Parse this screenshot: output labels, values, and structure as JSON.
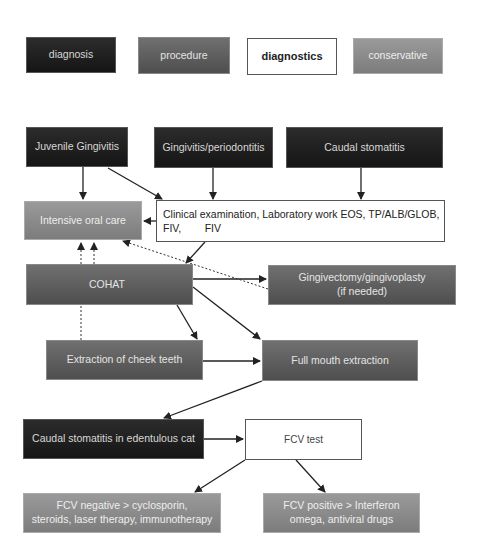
{
  "legend": {
    "diagnosis": "diagnosis",
    "procedure": "procedure",
    "diagnostics": "diagnostics",
    "conservative": "conservative"
  },
  "colors": {
    "diagnosis": "#1e1e1e",
    "procedure": "#5f5f5f",
    "diagnostics": "#ffffff",
    "conservative": "#8a8a8a",
    "edge": "#222222"
  },
  "nodes": {
    "juvenile_gingivitis": "Juvenile Gingivitis",
    "gingivitis_periodontitis": "Gingivitis/periodontitis",
    "caudal_stomatitis": "Caudal stomatitis",
    "intensive_oral_care": "Intensive oral care",
    "clinical_examination_line1": "Clinical examination, Laboratory work EOS, TP/ALB/GLOB,",
    "clinical_examination_line2": "FIV,        FIV",
    "cohat": "COHAT",
    "gingivectomy_line1": "Gingivectomy/gingivoplasty",
    "gingivectomy_line2": "(if needed)",
    "extraction_cheek_teeth": "Extraction of cheek teeth",
    "full_mouth_extraction": "Full mouth extraction",
    "caudal_stomatitis_edentulous": "Caudal stomatitis in edentulous cat",
    "fcv_test": "FCV test",
    "fcv_negative_line1": "FCV negative > cyclosporin,",
    "fcv_negative_line2": "steroids, laser therapy, immunotherapy",
    "fcv_positive_line1": "FCV positive > Interferon",
    "fcv_positive_line2": "omega, antiviral drugs"
  },
  "edges": [
    {
      "from": "Juvenile Gingivitis",
      "to": "Intensive oral care",
      "style": "solid"
    },
    {
      "from": "Juvenile Gingivitis",
      "to": "Clinical examination",
      "style": "solid"
    },
    {
      "from": "Gingivitis/periodontitis",
      "to": "Clinical examination",
      "style": "solid"
    },
    {
      "from": "Caudal stomatitis",
      "to": "Clinical examination",
      "style": "solid"
    },
    {
      "from": "Clinical examination",
      "to": "Intensive oral care",
      "style": "solid"
    },
    {
      "from": "Clinical examination",
      "to": "COHAT",
      "style": "solid"
    },
    {
      "from": "COHAT",
      "to": "Gingivectomy/gingivoplasty",
      "style": "solid"
    },
    {
      "from": "COHAT",
      "to": "Extraction of cheek teeth",
      "style": "solid"
    },
    {
      "from": "COHAT",
      "to": "Full mouth extraction",
      "style": "solid"
    },
    {
      "from": "Extraction of cheek teeth",
      "to": "Full mouth extraction",
      "style": "solid"
    },
    {
      "from": "Full mouth extraction",
      "to": "Caudal stomatitis in edentulous cat",
      "style": "solid"
    },
    {
      "from": "Caudal stomatitis in edentulous cat",
      "to": "FCV test",
      "style": "solid"
    },
    {
      "from": "FCV test",
      "to": "FCV negative",
      "style": "solid"
    },
    {
      "from": "FCV test",
      "to": "FCV positive",
      "style": "solid"
    },
    {
      "from": "COHAT",
      "to": "Intensive oral care",
      "style": "dotted"
    },
    {
      "from": "Extraction of cheek teeth",
      "to": "Intensive oral care",
      "style": "dotted"
    },
    {
      "from": "Gingivectomy/gingivoplasty",
      "to": "Intensive oral care",
      "style": "dotted"
    }
  ]
}
